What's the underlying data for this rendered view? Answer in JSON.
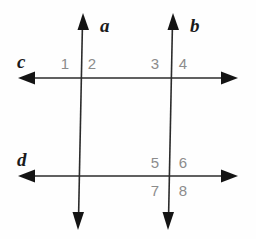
{
  "figure": {
    "type": "geometry-diagram",
    "width": 256,
    "height": 239,
    "background_color": "#ffffff",
    "stroke_color": "#1a1a1a",
    "number_color": "#8c8c8c"
  },
  "lines": [
    {
      "id": "a",
      "label": "a",
      "orientation": "vertical",
      "x1": 82,
      "y1": 14,
      "x2": 78,
      "y2": 228,
      "arrow_start": true,
      "arrow_end": true
    },
    {
      "id": "b",
      "label": "b",
      "orientation": "vertical",
      "x1": 172,
      "y1": 14,
      "x2": 168,
      "y2": 228,
      "arrow_start": true,
      "arrow_end": true
    },
    {
      "id": "c",
      "label": "c",
      "orientation": "horizontal",
      "x1": 20,
      "y1": 78,
      "x2": 236,
      "y2": 78,
      "arrow_start": true,
      "arrow_end": true
    },
    {
      "id": "d",
      "label": "d",
      "orientation": "horizontal",
      "x1": 20,
      "y1": 176,
      "x2": 236,
      "y2": 176,
      "arrow_start": true,
      "arrow_end": true
    }
  ],
  "angle_numbers": [
    {
      "id": "1",
      "label": "1",
      "position": "upper-left-of-a-at-c"
    },
    {
      "id": "2",
      "label": "2",
      "position": "upper-right-of-a-at-c"
    },
    {
      "id": "3",
      "label": "3",
      "position": "upper-left-of-b-at-c"
    },
    {
      "id": "4",
      "label": "4",
      "position": "upper-right-of-b-at-c"
    },
    {
      "id": "5",
      "label": "5",
      "position": "upper-left-of-b-at-d"
    },
    {
      "id": "6",
      "label": "6",
      "position": "upper-right-of-b-at-d"
    },
    {
      "id": "7",
      "label": "7",
      "position": "lower-left-of-b-at-d"
    },
    {
      "id": "8",
      "label": "8",
      "position": "lower-right-of-b-at-d"
    }
  ],
  "labels": {
    "line_a": "a",
    "line_b": "b",
    "line_c": "c",
    "line_d": "d",
    "angle_1": "1",
    "angle_2": "2",
    "angle_3": "3",
    "angle_4": "4",
    "angle_5": "5",
    "angle_6": "6",
    "angle_7": "7",
    "angle_8": "8"
  }
}
